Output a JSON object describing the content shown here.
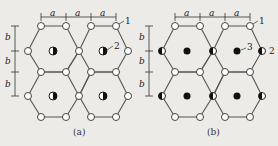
{
  "figure": {
    "panels": [
      {
        "id": "a",
        "caption": "(a)",
        "dimension_labels": {
          "horizontal": [
            "a",
            "a",
            "a"
          ],
          "vertical": [
            "b",
            "b",
            "b"
          ]
        },
        "callouts": [
          {
            "number": "1",
            "target": "hexagon corner node (hollow circle)"
          },
          {
            "number": "2",
            "target": "hexagon center node (half-filled circle)"
          }
        ]
      },
      {
        "id": "b",
        "caption": "(b)",
        "dimension_labels": {
          "horizontal": [
            "a",
            "a",
            "a"
          ],
          "vertical": [
            "b",
            "b",
            "b"
          ]
        },
        "callouts": [
          {
            "number": "1",
            "target": "hexagon corner node (hollow circle)"
          },
          {
            "number": "3",
            "target": "hexagon center node (solid circle)"
          },
          {
            "number": "2",
            "target": "hexagon side vertex (half-filled circle)"
          }
        ]
      }
    ],
    "colors": {
      "background": "#ecebe7",
      "line": "#555555",
      "fill": "#111111",
      "node_fill": "#ffffff"
    }
  }
}
